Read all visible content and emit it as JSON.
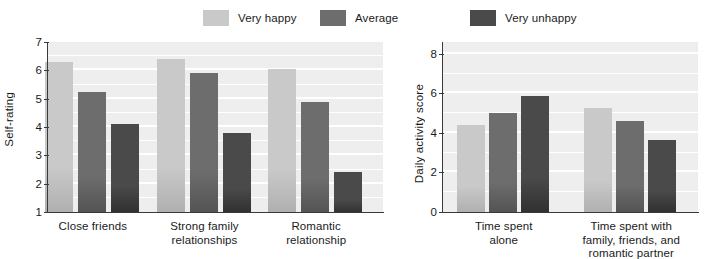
{
  "legend": {
    "items": [
      {
        "label": "Very happy",
        "color": "#c9c9c9"
      },
      {
        "label": "Average",
        "color": "#6d6d6d"
      },
      {
        "label": "Very unhappy",
        "color": "#4a4a4a"
      }
    ]
  },
  "colors": {
    "very_happy": "#c9c9c9",
    "average": "#6d6d6d",
    "very_unhappy": "#4a4a4a",
    "plot_background": "#eeeeee",
    "gridline": "#ffffff",
    "axis": "#3a3a3a",
    "text": "#1a1a1a"
  },
  "chart_data": [
    {
      "id": "left",
      "type": "bar",
      "title": "",
      "xlabel": "",
      "ylabel": "Self-rating",
      "ylim": [
        1,
        7
      ],
      "yticks": [
        1,
        2,
        3,
        4,
        5,
        6,
        7
      ],
      "ytick_labels": [
        "1",
        "2",
        "3",
        "4",
        "5",
        "6",
        "7"
      ],
      "grid": true,
      "legend_position": "top",
      "categories": [
        "Close friends",
        "Strong family\nrelationships",
        "Romantic\nrelationship"
      ],
      "series": [
        {
          "name": "Very happy",
          "color": "#c9c9c9",
          "values": [
            6.3,
            6.4,
            6.05
          ]
        },
        {
          "name": "Average",
          "color": "#6d6d6d",
          "values": [
            5.25,
            5.9,
            4.9
          ]
        },
        {
          "name": "Very unhappy",
          "color": "#4a4a4a",
          "values": [
            4.1,
            3.8,
            2.4
          ]
        }
      ]
    },
    {
      "id": "right",
      "type": "bar",
      "title": "",
      "xlabel": "",
      "ylabel": "Daily activity score",
      "ylim": [
        0,
        8.6
      ],
      "yticks": [
        0,
        2,
        4,
        6,
        8
      ],
      "ytick_labels": [
        "0",
        "2",
        "4",
        "6",
        "8"
      ],
      "grid": true,
      "legend_position": "top",
      "categories": [
        "Time spent\nalone",
        "Time spent with\nfamily, friends, and\nromantic partner"
      ],
      "series": [
        {
          "name": "Very happy",
          "color": "#c9c9c9",
          "values": [
            4.4,
            5.25
          ]
        },
        {
          "name": "Average",
          "color": "#6d6d6d",
          "values": [
            5.0,
            4.6
          ]
        },
        {
          "name": "Very unhappy",
          "color": "#4a4a4a",
          "values": [
            5.85,
            3.65
          ]
        }
      ]
    }
  ]
}
